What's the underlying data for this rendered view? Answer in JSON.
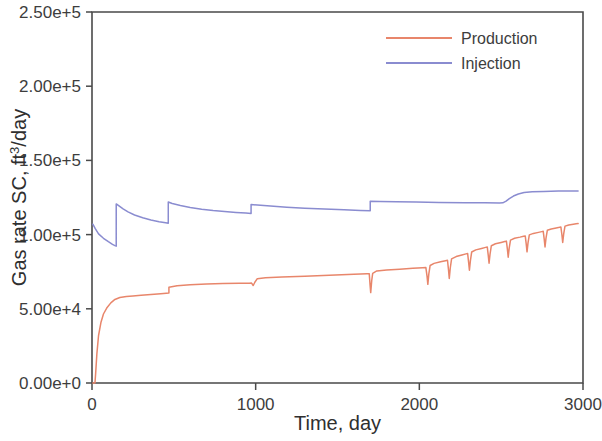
{
  "chart_data": {
    "type": "line",
    "title": "",
    "xlabel": "Time, day",
    "ylabel": "Gas rate SC, ft3/day",
    "ylabel_parts": {
      "pre": "Gas rate SC, ft",
      "sup": "3",
      "post": "/day"
    },
    "xlim": [
      0,
      3000
    ],
    "ylim": [
      0,
      250000
    ],
    "xticks": [
      0,
      1000,
      2000,
      3000
    ],
    "xtick_labels": [
      "0",
      "1000",
      "2000",
      "3000"
    ],
    "yticks": [
      0,
      50000,
      100000,
      150000,
      200000,
      250000
    ],
    "ytick_labels": [
      "0.00e+0",
      "5.00e+4",
      "1.00e+5",
      "1.50e+5",
      "2.00e+5",
      "2.50e+5"
    ],
    "grid": false,
    "legend_position": "top-right",
    "legend": [
      {
        "name": "Production",
        "color": "#E8866B"
      },
      {
        "name": "Injection",
        "color": "#8A8CD0"
      }
    ],
    "series": [
      {
        "name": "Production",
        "color": "#E8866B",
        "points": [
          [
            5,
            0
          ],
          [
            18,
            0
          ],
          [
            22,
            6000
          ],
          [
            30,
            20000
          ],
          [
            40,
            32000
          ],
          [
            55,
            41000
          ],
          [
            70,
            46500
          ],
          [
            90,
            50500
          ],
          [
            115,
            54000
          ],
          [
            140,
            56300
          ],
          [
            170,
            57600
          ],
          [
            210,
            58300
          ],
          [
            250,
            58700
          ],
          [
            300,
            59200
          ],
          [
            360,
            59700
          ],
          [
            420,
            60200
          ],
          [
            470,
            60700
          ],
          [
            470,
            64500
          ],
          [
            520,
            65600
          ],
          [
            600,
            66200
          ],
          [
            700,
            66700
          ],
          [
            800,
            67000
          ],
          [
            900,
            67200
          ],
          [
            960,
            67300
          ],
          [
            975,
            67350
          ],
          [
            985,
            65700
          ],
          [
            995,
            67900
          ],
          [
            1010,
            70300
          ],
          [
            1060,
            70900
          ],
          [
            1160,
            71400
          ],
          [
            1300,
            72000
          ],
          [
            1450,
            72600
          ],
          [
            1600,
            73200
          ],
          [
            1680,
            73600
          ],
          [
            1694,
            73700
          ],
          [
            1699,
            66000
          ],
          [
            1703,
            60900
          ],
          [
            1709,
            69000
          ],
          [
            1715,
            73900
          ],
          [
            1740,
            75500
          ],
          [
            1800,
            76100
          ],
          [
            1880,
            76700
          ],
          [
            1960,
            77300
          ],
          [
            2020,
            77700
          ],
          [
            2040,
            77800
          ],
          [
            2047,
            72000
          ],
          [
            2052,
            66500
          ],
          [
            2058,
            73500
          ],
          [
            2066,
            79200
          ],
          [
            2090,
            80600
          ],
          [
            2130,
            81700
          ],
          [
            2160,
            82400
          ],
          [
            2172,
            82700
          ],
          [
            2178,
            76500
          ],
          [
            2183,
            70500
          ],
          [
            2189,
            77500
          ],
          [
            2197,
            83600
          ],
          [
            2225,
            85200
          ],
          [
            2260,
            86300
          ],
          [
            2285,
            87000
          ],
          [
            2295,
            87300
          ],
          [
            2301,
            81500
          ],
          [
            2306,
            76000
          ],
          [
            2312,
            82500
          ],
          [
            2320,
            88300
          ],
          [
            2345,
            89700
          ],
          [
            2380,
            90700
          ],
          [
            2405,
            91400
          ],
          [
            2415,
            91700
          ],
          [
            2421,
            86200
          ],
          [
            2426,
            80700
          ],
          [
            2432,
            86800
          ],
          [
            2440,
            92500
          ],
          [
            2465,
            93800
          ],
          [
            2500,
            94700
          ],
          [
            2522,
            95300
          ],
          [
            2532,
            95600
          ],
          [
            2538,
            90200
          ],
          [
            2543,
            84800
          ],
          [
            2549,
            90900
          ],
          [
            2557,
            96300
          ],
          [
            2582,
            97500
          ],
          [
            2615,
            98300
          ],
          [
            2637,
            98900
          ],
          [
            2647,
            99100
          ],
          [
            2653,
            93800
          ],
          [
            2658,
            88400
          ],
          [
            2664,
            94400
          ],
          [
            2672,
            99800
          ],
          [
            2697,
            100800
          ],
          [
            2728,
            101500
          ],
          [
            2748,
            102000
          ],
          [
            2757,
            102200
          ],
          [
            2763,
            97000
          ],
          [
            2768,
            91700
          ],
          [
            2774,
            97600
          ],
          [
            2782,
            102900
          ],
          [
            2806,
            103800
          ],
          [
            2836,
            104500
          ],
          [
            2856,
            104900
          ],
          [
            2865,
            105100
          ],
          [
            2871,
            99900
          ],
          [
            2876,
            94700
          ],
          [
            2882,
            100500
          ],
          [
            2890,
            105700
          ],
          [
            2913,
            106500
          ],
          [
            2941,
            107000
          ],
          [
            2958,
            107300
          ],
          [
            2970,
            107400
          ]
        ]
      },
      {
        "name": "Injection",
        "color": "#8A8CD0",
        "points": [
          [
            5,
            107000
          ],
          [
            20,
            104000
          ],
          [
            40,
            100500
          ],
          [
            70,
            97500
          ],
          [
            100,
            95200
          ],
          [
            125,
            93400
          ],
          [
            140,
            92600
          ],
          [
            148,
            92200
          ],
          [
            148,
            120700
          ],
          [
            165,
            119300
          ],
          [
            190,
            117300
          ],
          [
            220,
            115300
          ],
          [
            260,
            113200
          ],
          [
            310,
            111300
          ],
          [
            360,
            109800
          ],
          [
            410,
            108700
          ],
          [
            450,
            108000
          ],
          [
            466,
            107700
          ],
          [
            466,
            122000
          ],
          [
            490,
            121000
          ],
          [
            540,
            119600
          ],
          [
            600,
            118300
          ],
          [
            670,
            117100
          ],
          [
            740,
            116200
          ],
          [
            810,
            115500
          ],
          [
            880,
            114900
          ],
          [
            940,
            114500
          ],
          [
            972,
            114300
          ],
          [
            972,
            120300
          ],
          [
            1010,
            119900
          ],
          [
            1090,
            119200
          ],
          [
            1190,
            118500
          ],
          [
            1300,
            117800
          ],
          [
            1420,
            117200
          ],
          [
            1540,
            116700
          ],
          [
            1640,
            116300
          ],
          [
            1700,
            116100
          ],
          [
            1700,
            122500
          ],
          [
            1760,
            122300
          ],
          [
            1860,
            122100
          ],
          [
            1980,
            121900
          ],
          [
            2120,
            121700
          ],
          [
            2280,
            121500
          ],
          [
            2400,
            121400
          ],
          [
            2490,
            121350
          ],
          [
            2510,
            121400
          ],
          [
            2530,
            122600
          ],
          [
            2550,
            124300
          ],
          [
            2575,
            126000
          ],
          [
            2605,
            127400
          ],
          [
            2640,
            128300
          ],
          [
            2690,
            128800
          ],
          [
            2760,
            129100
          ],
          [
            2850,
            129300
          ],
          [
            2930,
            129400
          ],
          [
            2970,
            129450
          ]
        ]
      }
    ]
  },
  "legend_box": {
    "production": "Production",
    "injection": "Injection"
  }
}
